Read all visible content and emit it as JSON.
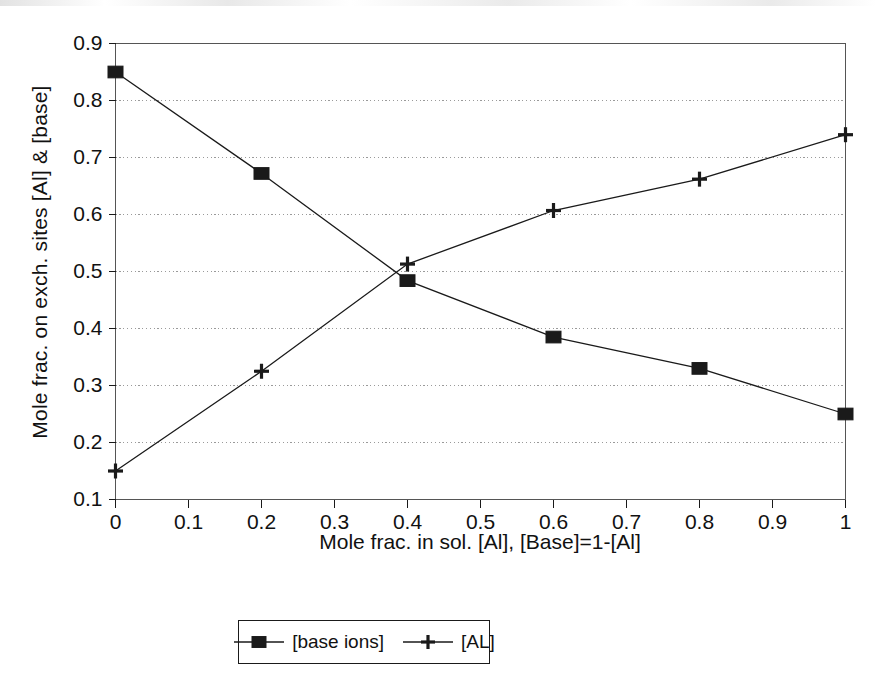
{
  "chart_data": {
    "type": "line",
    "title": "",
    "subtitle": "",
    "xlabel": "Mole frac. in sol. [Al], [Base]=1-[Al]",
    "ylabel": "Mole frac. on exch. sites [Al] & [base]",
    "xlim": [
      0,
      1
    ],
    "ylim": [
      0.1,
      0.9
    ],
    "xticks": [
      0,
      0.1,
      0.2,
      0.3,
      0.4,
      0.5,
      0.6,
      0.7,
      0.8,
      0.9,
      1
    ],
    "xtick_labels": [
      "0",
      "0.1",
      "0.2",
      "0.3",
      "0.4",
      "0.5",
      "0.6",
      "0.7",
      "0.8",
      "0.9",
      "1"
    ],
    "yticks": [
      0.1,
      0.2,
      0.3,
      0.4,
      0.5,
      0.6,
      0.7,
      0.8,
      0.9
    ],
    "ytick_labels": [
      "0.1",
      "0.2",
      "0.3",
      "0.4",
      "0.5",
      "0.6",
      "0.7",
      "0.8",
      "0.9"
    ],
    "grid": "horizontal-dotted",
    "grid_values": [
      0.2,
      0.3,
      0.4,
      0.5,
      0.6,
      0.7,
      0.8
    ],
    "legend_position": "bottom-center",
    "line_color": "#1a1a1a",
    "x": [
      0,
      0.2,
      0.4,
      0.6,
      0.8,
      1
    ],
    "series": [
      {
        "name": "[base ions]",
        "marker": "square",
        "values": [
          0.85,
          0.672,
          0.484,
          0.385,
          0.33,
          0.25
        ]
      },
      {
        "name": "[AL]",
        "marker": "plus",
        "values": [
          0.15,
          0.325,
          0.513,
          0.607,
          0.662,
          0.74
        ]
      }
    ]
  },
  "legend": {
    "entries": [
      {
        "label": "[base ions]",
        "marker": "square"
      },
      {
        "label": "[AL]",
        "marker": "plus"
      }
    ]
  }
}
